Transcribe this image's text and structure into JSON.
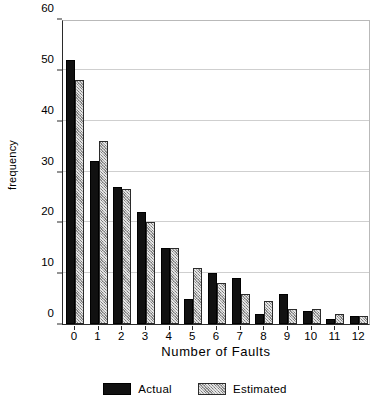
{
  "chart_data": {
    "type": "bar",
    "title": "",
    "xlabel": "Number of Faults",
    "ylabel": "frequency",
    "categories": [
      "0",
      "1",
      "2",
      "3",
      "4",
      "5",
      "6",
      "7",
      "8",
      "9",
      "10",
      "11",
      "12"
    ],
    "series": [
      {
        "name": "Actual",
        "color": "#111111",
        "values": [
          52,
          32,
          27,
          22,
          15,
          5,
          10,
          9,
          2,
          6,
          2.5,
          1,
          1.5
        ]
      },
      {
        "name": "Estimated",
        "color": "#a8a8a8",
        "values": [
          48,
          36,
          26.5,
          20,
          15,
          11,
          8,
          6,
          4.5,
          3,
          3,
          2,
          1.5
        ]
      }
    ],
    "ylim": [
      0,
      60
    ],
    "yticks": [
      0,
      10,
      20,
      30,
      40,
      50,
      60
    ],
    "ytick_labels": [
      "0",
      "10",
      "20",
      "30",
      "40",
      "50",
      "60"
    ],
    "grid": true,
    "legend_position": "bottom"
  },
  "legend": {
    "entries": [
      {
        "label": "Actual",
        "swatch": "solid-black-swatch"
      },
      {
        "label": "Estimated",
        "swatch": "hatched-gray-swatch"
      }
    ]
  },
  "colors": {
    "actual": "#111111",
    "estimated": "#a8a8a8",
    "gridline": "#cfcfcf",
    "axis": "#2b2b2b",
    "background": "#ffffff"
  }
}
